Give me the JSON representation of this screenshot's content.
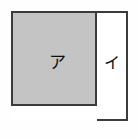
{
  "figure": {
    "background_color": "#ffffff",
    "outline_color": "#3b3b3b",
    "shaded_fill_color": "#c4c4c4",
    "unshaded_fill_color": "#ffffff"
  },
  "regions": [
    {
      "id": "shaded-rect",
      "label": "ア",
      "fill": "shaded",
      "fill_color": "#c4c4c4"
    },
    {
      "id": "white-column",
      "label": "イ",
      "fill": "unshaded",
      "fill_color": "#ffffff"
    },
    {
      "id": "white-strip",
      "label": "",
      "fill": "unshaded",
      "fill_color": "#ffffff"
    }
  ],
  "labels": {
    "region_a": "ア",
    "region_i": "イ"
  }
}
